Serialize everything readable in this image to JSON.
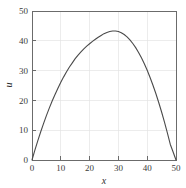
{
  "chart_data": {
    "type": "line",
    "title": "",
    "xlabel": "x",
    "ylabel": "u",
    "xlim": [
      0,
      50
    ],
    "ylim": [
      0,
      50
    ],
    "grid": true,
    "legend": null,
    "xticks": [
      0,
      10,
      20,
      30,
      40,
      50
    ],
    "yticks": [
      0,
      10,
      20,
      30,
      40,
      50
    ],
    "xtick_labels": [
      "0",
      "10",
      "20",
      "30",
      "40",
      "50"
    ],
    "ytick_labels": [
      "0",
      "10",
      "20",
      "30",
      "40",
      "50"
    ],
    "series": [
      {
        "name": "u(x)",
        "color": "#4a4a4a",
        "x": [
          0,
          1,
          2,
          3,
          4,
          5,
          6,
          7,
          8,
          9,
          10,
          11,
          12,
          13,
          14,
          15,
          16,
          17,
          18,
          19,
          20,
          21,
          22,
          23,
          24,
          25,
          26,
          27,
          28,
          29,
          30,
          31,
          32,
          33,
          34,
          35,
          36,
          37,
          38,
          39,
          40,
          41,
          42,
          43,
          44,
          45,
          46,
          47,
          48,
          49,
          50
        ],
        "y": [
          0.0,
          3.3,
          6.4,
          9.4,
          12.2,
          14.9,
          17.4,
          19.8,
          22.0,
          24.1,
          26.1,
          27.9,
          29.6,
          31.2,
          32.6,
          34.0,
          35.2,
          36.3,
          37.3,
          38.2,
          39.0,
          39.8,
          40.5,
          41.2,
          41.8,
          42.4,
          42.8,
          43.1,
          43.3,
          43.3,
          43.1,
          42.7,
          42.1,
          41.3,
          40.3,
          39.1,
          37.7,
          36.1,
          34.3,
          32.3,
          30.1,
          27.7,
          25.1,
          22.3,
          19.3,
          16.1,
          12.7,
          9.1,
          5.3,
          2.7,
          0.0
        ]
      }
    ]
  },
  "axes": {
    "x_axis_title": "x",
    "y_axis_title": "u"
  }
}
